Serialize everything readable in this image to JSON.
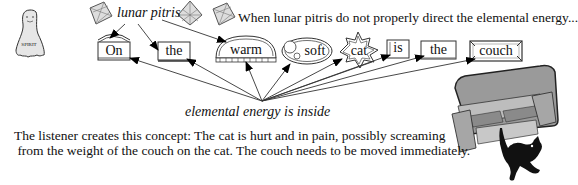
{
  "diagram": {
    "spirit_label": "SPIRIT",
    "lunar_label": "lunar pitris",
    "top_caption": "When lunar pitris do not properly direct the elemental energy...",
    "energy_label": "elemental energy is inside",
    "words": [
      {
        "text": "On",
        "shape": "dome-box"
      },
      {
        "text": "the",
        "shape": "box"
      },
      {
        "text": "warm",
        "shape": "half-dome"
      },
      {
        "text": "soft",
        "shape": "ellipse"
      },
      {
        "text": "cat",
        "shape": "starburst"
      },
      {
        "text": "is",
        "shape": "small-box"
      },
      {
        "text": "the",
        "shape": "box"
      },
      {
        "text": "couch",
        "shape": "ornate-box"
      }
    ],
    "concept_line1": "The listener creates this concept: The cat is hurt and in pain, possibly screaming",
    "concept_line2": " from the weight of the couch on the cat. The couch needs to be moved immediately.",
    "illustration": "couch-falling-on-cat"
  }
}
